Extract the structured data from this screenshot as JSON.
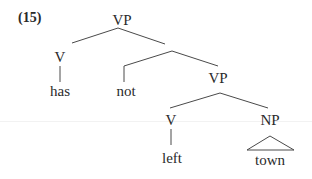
{
  "example_number": "(15)",
  "tree": {
    "root": "VP",
    "nodes": {
      "vp_top": "VP",
      "v_has": "V",
      "has": "has",
      "not": "not",
      "vp_low": "VP",
      "v_left": "V",
      "left": "left",
      "np": "NP",
      "town": "town"
    },
    "bracketing": "[VP [V has] [ [not] [VP [V left] [NP town]]]]"
  },
  "colors": {
    "line": "#4a4a4a",
    "text": "#2a2a2a"
  }
}
